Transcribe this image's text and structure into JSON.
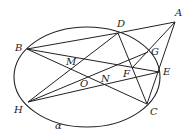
{
  "diagram": {
    "plane_label": "α",
    "points": {
      "A": {
        "label": "A",
        "x": 175,
        "y": 22,
        "lx": 175,
        "ly": 8
      },
      "B": {
        "label": "B",
        "x": 27,
        "y": 49,
        "lx": 15,
        "ly": 43
      },
      "C": {
        "label": "C",
        "x": 147,
        "y": 104,
        "lx": 150,
        "ly": 107
      },
      "D": {
        "label": "D",
        "x": 118,
        "y": 33,
        "lx": 117,
        "ly": 19
      },
      "E": {
        "label": "E",
        "x": 159,
        "y": 72,
        "lx": 163,
        "ly": 67
      },
      "F": {
        "label": "F",
        "x": 133,
        "y": 67,
        "lx": 123,
        "ly": 69
      },
      "G": {
        "label": "G",
        "x": 148,
        "y": 52,
        "lx": 151,
        "ly": 47
      },
      "H": {
        "label": "H",
        "x": 28,
        "y": 102,
        "lx": 14,
        "ly": 105
      },
      "M": {
        "label": "M",
        "x": 72,
        "y": 67,
        "lx": 66,
        "ly": 57
      },
      "N": {
        "label": "N",
        "x": 105,
        "y": 83,
        "lx": 101,
        "ly": 74
      },
      "O": {
        "label": "O",
        "x": 85,
        "y": 77,
        "lx": 80,
        "ly": 79
      }
    },
    "ellipse": {
      "cx": 87,
      "cy": 77,
      "rx": 73,
      "ry": 50
    },
    "segments": [
      [
        "B",
        "D"
      ],
      [
        "D",
        "A"
      ],
      [
        "B",
        "E"
      ],
      [
        "B",
        "C"
      ],
      [
        "D",
        "C"
      ],
      [
        "D",
        "H"
      ],
      [
        "H",
        "G"
      ],
      [
        "H",
        "E"
      ],
      [
        "A",
        "C"
      ],
      [
        "A",
        "F"
      ]
    ]
  }
}
